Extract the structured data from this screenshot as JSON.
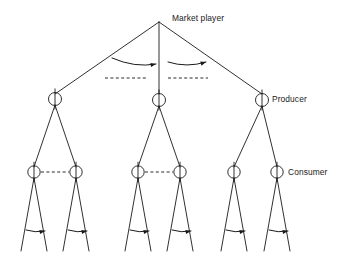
{
  "diagram": {
    "type": "tree-diagram",
    "background_color": "#ffffff",
    "line_color": "#1a1a1a",
    "labels": {
      "market_player": "Market player",
      "producer": "Producer",
      "consumer": "Consumer"
    },
    "root": {
      "name": "market-player-root",
      "x": 159,
      "y": 22
    },
    "level2_nodes": [
      {
        "name": "level2-node-left",
        "x": 55,
        "y": 99,
        "radius": 6.5
      },
      {
        "name": "level2-node-middle",
        "x": 159,
        "y": 100,
        "radius": 6.5
      },
      {
        "name": "level2-node-right",
        "x": 262,
        "y": 100,
        "radius": 6.5,
        "label": "Producer"
      }
    ],
    "level3_nodes": [
      {
        "name": "level3-node-1",
        "x": 34,
        "y": 172,
        "radius": 6.2
      },
      {
        "name": "level3-node-2",
        "x": 76,
        "y": 172,
        "radius": 6.2
      },
      {
        "name": "level3-node-3",
        "x": 138,
        "y": 172,
        "radius": 6.2
      },
      {
        "name": "level3-node-4",
        "x": 180,
        "y": 172,
        "radius": 6.2
      },
      {
        "name": "level3-node-5",
        "x": 234,
        "y": 172,
        "radius": 6.2
      },
      {
        "name": "level3-node-6",
        "x": 277,
        "y": 172,
        "radius": 6.2,
        "label": "Consumer"
      }
    ],
    "root_edges": [
      {
        "name": "root-edge-left",
        "x1": 159,
        "y1": 22,
        "x2": 55,
        "y2": 94
      },
      {
        "name": "root-edge-middle",
        "x1": 159,
        "y1": 22,
        "x2": 159,
        "y2": 94
      },
      {
        "name": "root-edge-right",
        "x1": 159,
        "y1": 22,
        "x2": 262,
        "y2": 94
      }
    ],
    "branch_edges": [
      {
        "name": "branch-edge-1",
        "x1": 55,
        "y1": 105,
        "x2": 34,
        "y2": 167
      },
      {
        "name": "branch-edge-2",
        "x1": 55,
        "y1": 105,
        "x2": 76,
        "y2": 167
      },
      {
        "name": "branch-edge-3",
        "x1": 159,
        "y1": 106,
        "x2": 138,
        "y2": 167
      },
      {
        "name": "branch-edge-4",
        "x1": 159,
        "y1": 106,
        "x2": 180,
        "y2": 167
      },
      {
        "name": "branch-edge-5",
        "x1": 262,
        "y1": 106,
        "x2": 234,
        "y2": 167
      },
      {
        "name": "branch-edge-6",
        "x1": 262,
        "y1": 106,
        "x2": 277,
        "y2": 167
      }
    ],
    "leaf_edges": [
      {
        "name": "leaf-edge-1a",
        "x1": 34,
        "y1": 178,
        "x2": 21,
        "y2": 251
      },
      {
        "name": "leaf-edge-1b",
        "x1": 34,
        "y1": 178,
        "x2": 47,
        "y2": 251
      },
      {
        "name": "leaf-edge-2a",
        "x1": 76,
        "y1": 178,
        "x2": 63,
        "y2": 251
      },
      {
        "name": "leaf-edge-2b",
        "x1": 76,
        "y1": 178,
        "x2": 89,
        "y2": 251
      },
      {
        "name": "leaf-edge-3a",
        "x1": 138,
        "y1": 178,
        "x2": 125,
        "y2": 251
      },
      {
        "name": "leaf-edge-3b",
        "x1": 138,
        "y1": 178,
        "x2": 151,
        "y2": 251
      },
      {
        "name": "leaf-edge-4a",
        "x1": 180,
        "y1": 178,
        "x2": 167,
        "y2": 251
      },
      {
        "name": "leaf-edge-4b",
        "x1": 180,
        "y1": 178,
        "x2": 193,
        "y2": 251
      },
      {
        "name": "leaf-edge-5a",
        "x1": 234,
        "y1": 178,
        "x2": 221,
        "y2": 251
      },
      {
        "name": "leaf-edge-5b",
        "x1": 234,
        "y1": 178,
        "x2": 247,
        "y2": 251
      },
      {
        "name": "leaf-edge-6a",
        "x1": 277,
        "y1": 178,
        "x2": 264,
        "y2": 251
      },
      {
        "name": "leaf-edge-6b",
        "x1": 277,
        "y1": 178,
        "x2": 290,
        "y2": 251
      }
    ],
    "dashed_links": [
      {
        "name": "dashed-link-top-left",
        "x1": 105,
        "y1": 78,
        "x2": 148,
        "y2": 78
      },
      {
        "name": "dashed-link-top-right",
        "x1": 168,
        "y1": 78,
        "x2": 208,
        "y2": 78
      },
      {
        "name": "dashed-link-mid-left",
        "x1": 41,
        "y1": 172,
        "x2": 69,
        "y2": 172
      },
      {
        "name": "dashed-link-mid-right",
        "x1": 145,
        "y1": 172,
        "x2": 173,
        "y2": 172
      }
    ],
    "flow_arrows": [
      {
        "name": "flow-arrow-top-left",
        "x1": 112,
        "y1": 58,
        "cx": 135,
        "cy": 68,
        "x2": 156,
        "y2": 64
      },
      {
        "name": "flow-arrow-top-right",
        "x1": 168,
        "y1": 62,
        "cx": 187,
        "cy": 68,
        "x2": 206,
        "y2": 62
      },
      {
        "name": "flow-arrow-leaf-1",
        "x1": 26,
        "y1": 230,
        "cx": 35,
        "cy": 233,
        "x2": 45,
        "y2": 231
      },
      {
        "name": "flow-arrow-leaf-2",
        "x1": 68,
        "y1": 230,
        "cx": 77,
        "cy": 233,
        "x2": 87,
        "y2": 231
      },
      {
        "name": "flow-arrow-leaf-3",
        "x1": 130,
        "y1": 230,
        "cx": 139,
        "cy": 233,
        "x2": 149,
        "y2": 231
      },
      {
        "name": "flow-arrow-leaf-4",
        "x1": 172,
        "y1": 230,
        "cx": 181,
        "cy": 233,
        "x2": 191,
        "y2": 231
      },
      {
        "name": "flow-arrow-leaf-5",
        "x1": 226,
        "y1": 230,
        "cx": 235,
        "cy": 233,
        "x2": 245,
        "y2": 231
      },
      {
        "name": "flow-arrow-leaf-6",
        "x1": 269,
        "y1": 230,
        "cx": 278,
        "cy": 233,
        "x2": 288,
        "y2": 231
      }
    ]
  }
}
